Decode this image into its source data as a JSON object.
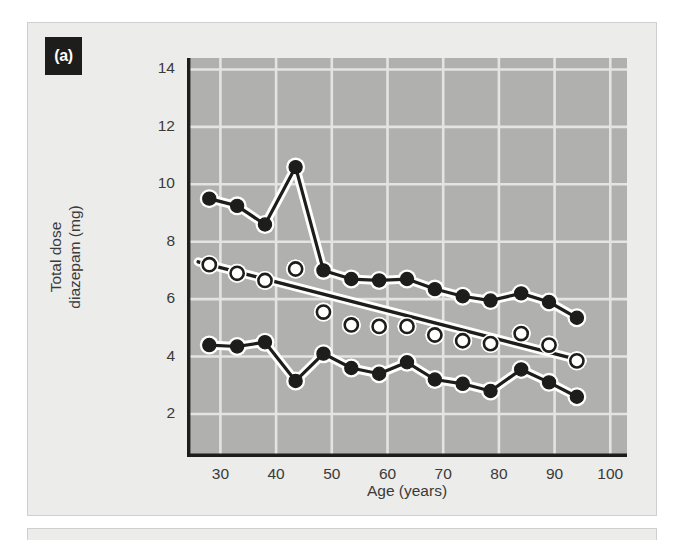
{
  "figure": {
    "panel_label": "(a)",
    "background": "#ececeb",
    "plot_background": "#b0b0ae",
    "grid_color": "#e4e4e2",
    "axis_color": "#1d1d1b"
  },
  "axes": {
    "y_title": "Total dose\ndiazepam (mg)",
    "x_title": "Age (years)",
    "y_ticks": [
      14,
      12,
      10,
      8,
      6,
      4,
      2
    ],
    "x_ticks": [
      30,
      40,
      50,
      60,
      70,
      80,
      90,
      100
    ]
  },
  "chart_data": {
    "type": "line",
    "title": "",
    "subtitle": "",
    "xlabel": "Age (years)",
    "ylabel": "Total dose diazepam (mg)",
    "xlim": [
      24,
      103
    ],
    "ylim": [
      0.5,
      14.4
    ],
    "grid": true,
    "legend_position": "none",
    "annotations": [
      "(a)"
    ],
    "series": [
      {
        "name": "upper-percentile",
        "marker": "filled-circle",
        "line": "solid",
        "x": [
          28,
          33,
          38,
          43.5,
          48.5,
          53.5,
          58.5,
          63.5,
          68.5,
          73.5,
          78.5,
          84,
          89,
          94
        ],
        "values": [
          9.5,
          9.25,
          8.6,
          10.6,
          7.0,
          6.7,
          6.65,
          6.7,
          6.35,
          6.1,
          5.95,
          6.2,
          5.9,
          5.35
        ]
      },
      {
        "name": "median-open-circle",
        "marker": "open-circle",
        "line": "none",
        "x": [
          28,
          33,
          38,
          43.5,
          48.5,
          53.5,
          58.5,
          63.5,
          68.5,
          73.5,
          78.5,
          84,
          89,
          94
        ],
        "values": [
          7.2,
          6.9,
          6.65,
          7.05,
          5.55,
          5.1,
          5.05,
          5.05,
          4.75,
          4.55,
          4.45,
          4.8,
          4.4,
          3.85
        ]
      },
      {
        "name": "lower-percentile",
        "marker": "filled-circle",
        "line": "solid",
        "x": [
          28,
          33,
          38,
          43.5,
          48.5,
          53.5,
          58.5,
          63.5,
          68.5,
          73.5,
          78.5,
          84,
          89,
          94
        ],
        "values": [
          4.4,
          4.35,
          4.5,
          3.15,
          4.1,
          3.6,
          3.4,
          3.8,
          3.2,
          3.05,
          2.8,
          3.55,
          3.1,
          2.6
        ]
      }
    ],
    "regression_line": {
      "name": "fitted-trend-line",
      "x": [
        26,
        95
      ],
      "values": [
        7.3,
        3.85
      ]
    }
  }
}
